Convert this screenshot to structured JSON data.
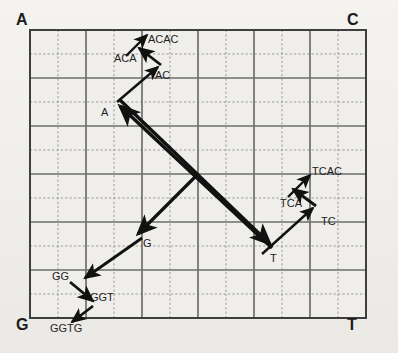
{
  "figure": {
    "type": "chaos-game-representation",
    "grid": {
      "left": 30,
      "top": 30,
      "right": 366,
      "bottom": 318,
      "minor_cols": 12,
      "minor_rows": 12,
      "major_every": 2,
      "major_color": "#6b6b6b",
      "minor_color": "#8a8a8a",
      "border_color": "#4a4a4a",
      "fill_color": "#efeeeb"
    },
    "corners": [
      {
        "id": "corner-a",
        "label": "A",
        "x": 16,
        "y": 12
      },
      {
        "id": "corner-c",
        "label": "C",
        "x": 347,
        "y": 12
      },
      {
        "id": "corner-g",
        "label": "G",
        "x": 16,
        "y": 317
      },
      {
        "id": "corner-t",
        "label": "T",
        "x": 347,
        "y": 317
      }
    ],
    "nodes": [
      {
        "id": "node-a",
        "label": "A",
        "x": 101,
        "y": 107
      },
      {
        "id": "node-ac",
        "label": "AC",
        "x": 155,
        "y": 70
      },
      {
        "id": "node-aca",
        "label": "ACA",
        "x": 114,
        "y": 53
      },
      {
        "id": "node-acac",
        "label": "ACAC",
        "x": 148,
        "y": 34
      },
      {
        "id": "node-g",
        "label": "G",
        "x": 143,
        "y": 238
      },
      {
        "id": "node-gg",
        "label": "GG",
        "x": 52,
        "y": 271
      },
      {
        "id": "node-ggt",
        "label": "GGT",
        "x": 90,
        "y": 292
      },
      {
        "id": "node-ggtg",
        "label": "GGTG",
        "x": 50,
        "y": 323
      },
      {
        "id": "node-t",
        "label": "T",
        "x": 270,
        "y": 253
      },
      {
        "id": "node-tc",
        "label": "TC",
        "x": 321,
        "y": 216
      },
      {
        "id": "node-tca",
        "label": "TCA",
        "x": 280,
        "y": 198
      },
      {
        "id": "node-tcac",
        "label": "TCAC",
        "x": 312,
        "y": 166
      }
    ],
    "arrows": [
      {
        "id": "arrow-t-to-a",
        "from": "T",
        "to": "A",
        "x1": 272,
        "y1": 248,
        "x2": 116,
        "y2": 104
      },
      {
        "id": "arrow-a-to-ac",
        "from": "A",
        "to": "AC",
        "x1": 116,
        "y1": 104,
        "x2": 160,
        "y2": 66
      },
      {
        "id": "arrow-ac-to-aca",
        "from": "AC",
        "to": "ACA",
        "x1": 160,
        "y1": 66,
        "x2": 137,
        "y2": 47
      },
      {
        "id": "arrow-aca-to-acac",
        "from": "ACA",
        "to": "ACAC",
        "x1": 125,
        "y1": 55,
        "x2": 148,
        "y2": 33
      },
      {
        "id": "arrow-a-to-t",
        "from": "A",
        "to": "T",
        "x1": 118,
        "y1": 102,
        "x2": 272,
        "y2": 246
      },
      {
        "id": "arrow-t-to-tc",
        "from": "T",
        "to": "TC",
        "x1": 262,
        "y1": 252,
        "x2": 312,
        "y2": 208
      },
      {
        "id": "arrow-tc-to-tca",
        "from": "TC",
        "to": "TCA",
        "x1": 314,
        "y1": 206,
        "x2": 291,
        "y2": 188
      },
      {
        "id": "arrow-tca-to-tcac",
        "from": "TCA",
        "to": "TCAC",
        "x1": 287,
        "y1": 196,
        "x2": 311,
        "y2": 173
      },
      {
        "id": "arrow-center-to-g",
        "from": "center",
        "to": "G",
        "x1": 196,
        "y1": 176,
        "x2": 139,
        "y2": 233
      },
      {
        "id": "arrow-g-to-gg",
        "from": "G",
        "to": "GG",
        "x1": 142,
        "y1": 238,
        "x2": 84,
        "y2": 277
      },
      {
        "id": "arrow-gg-to-ggt",
        "from": "GG",
        "to": "GGT",
        "x1": 71,
        "y1": 281,
        "x2": 94,
        "y2": 300
      },
      {
        "id": "arrow-ggt-to-ggtg",
        "from": "GGT",
        "to": "GGTG",
        "x1": 92,
        "y1": 305,
        "x2": 71,
        "y2": 321
      }
    ],
    "arrow_color": "#111111"
  }
}
